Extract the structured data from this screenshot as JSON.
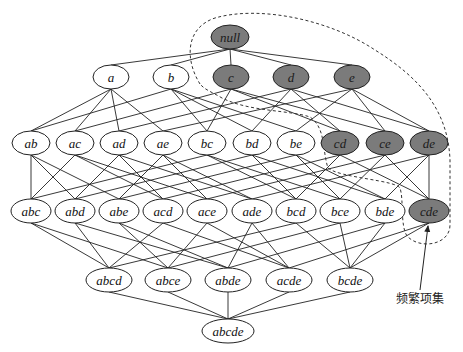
{
  "diagram": {
    "type": "itemset-lattice",
    "colors": {
      "frequent_fill": "#7b7b7b",
      "infrequent_fill": "#ffffff",
      "stroke": "#222222",
      "edge": "#222222",
      "boundary": "#333333"
    },
    "levels": [
      {
        "y": 37,
        "rx": 19,
        "ry": 12,
        "nodes": [
          {
            "id": "null",
            "label": "null",
            "x": 230,
            "frequent": true
          }
        ]
      },
      {
        "y": 77,
        "rx": 18,
        "ry": 12,
        "nodes": [
          {
            "id": "a",
            "label": "a",
            "x": 111,
            "frequent": false
          },
          {
            "id": "b",
            "label": "b",
            "x": 171,
            "frequent": false
          },
          {
            "id": "c",
            "label": "c",
            "x": 231,
            "frequent": true
          },
          {
            "id": "d",
            "label": "d",
            "x": 291,
            "frequent": true
          },
          {
            "id": "e",
            "label": "e",
            "x": 352,
            "frequent": true
          }
        ]
      },
      {
        "y": 143,
        "rx": 19,
        "ry": 12,
        "nodes": [
          {
            "id": "ab",
            "label": "ab",
            "x": 31,
            "frequent": false
          },
          {
            "id": "ac",
            "label": "ac",
            "x": 75,
            "frequent": false
          },
          {
            "id": "ad",
            "label": "ad",
            "x": 119,
            "frequent": false
          },
          {
            "id": "ae",
            "label": "ae",
            "x": 163,
            "frequent": false
          },
          {
            "id": "bc",
            "label": "bc",
            "x": 207,
            "frequent": false
          },
          {
            "id": "bd",
            "label": "bd",
            "x": 252,
            "frequent": false
          },
          {
            "id": "be",
            "label": "be",
            "x": 296,
            "frequent": false
          },
          {
            "id": "cd",
            "label": "cd",
            "x": 340,
            "frequent": true
          },
          {
            "id": "ce",
            "label": "ce",
            "x": 385,
            "frequent": true
          },
          {
            "id": "de",
            "label": "de",
            "x": 429,
            "frequent": true
          }
        ]
      },
      {
        "y": 211,
        "rx": 20,
        "ry": 12,
        "nodes": [
          {
            "id": "abc",
            "label": "abc",
            "x": 31,
            "frequent": false
          },
          {
            "id": "abd",
            "label": "abd",
            "x": 75,
            "frequent": false
          },
          {
            "id": "abe",
            "label": "abe",
            "x": 119,
            "frequent": false
          },
          {
            "id": "acd",
            "label": "acd",
            "x": 163,
            "frequent": false
          },
          {
            "id": "ace",
            "label": "ace",
            "x": 207,
            "frequent": false
          },
          {
            "id": "ade",
            "label": "ade",
            "x": 252,
            "frequent": false
          },
          {
            "id": "bcd",
            "label": "bcd",
            "x": 296,
            "frequent": false
          },
          {
            "id": "bce",
            "label": "bce",
            "x": 340,
            "frequent": false
          },
          {
            "id": "bde",
            "label": "bde",
            "x": 385,
            "frequent": false
          },
          {
            "id": "cde",
            "label": "cde",
            "x": 429,
            "frequent": true
          }
        ]
      },
      {
        "y": 280,
        "rx": 23,
        "ry": 12,
        "nodes": [
          {
            "id": "abcd",
            "label": "abcd",
            "x": 109,
            "frequent": false
          },
          {
            "id": "abce",
            "label": "abce",
            "x": 168,
            "frequent": false
          },
          {
            "id": "abde",
            "label": "abde",
            "x": 228,
            "frequent": false
          },
          {
            "id": "acde",
            "label": "acde",
            "x": 289,
            "frequent": false
          },
          {
            "id": "bcde",
            "label": "bcde",
            "x": 350,
            "frequent": false
          }
        ]
      },
      {
        "y": 331,
        "rx": 26,
        "ry": 12,
        "nodes": [
          {
            "id": "abcde",
            "label": "abcde",
            "x": 228,
            "frequent": false
          }
        ]
      }
    ],
    "boundary_path": "M 200 84 C 185 60, 185 28, 215 18 C 260 5, 330 20, 375 50 C 420 78, 448 110, 450 160 L 450 225 C 450 245, 420 250, 407 236 C 400 225, 404 200, 400 188 C 395 180, 340 178, 328 168 C 322 150, 326 128, 310 117 C 290 110, 250 112, 222 98 C 212 92, 205 90, 200 84 Z",
    "annotation": {
      "label": "频繁项集",
      "label_x": 420,
      "label_y": 303,
      "arrow_from": [
        420,
        290
      ],
      "arrow_to": [
        428,
        226
      ]
    }
  }
}
